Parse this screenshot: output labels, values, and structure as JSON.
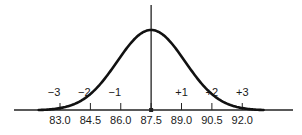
{
  "chart_data": {
    "type": "line",
    "title": "",
    "subtitle": "",
    "xlabel": "",
    "ylabel": "",
    "mean": 87.5,
    "std_dev": 1.5,
    "xlim": [
      79.7,
      93.5
    ],
    "ylim": [
      0,
      1
    ],
    "grid": false,
    "legend": "none",
    "x_ticks": [
      {
        "value": 83.0,
        "label": "83.0"
      },
      {
        "value": 84.5,
        "label": "84.5"
      },
      {
        "value": 86.0,
        "label": "86.0"
      },
      {
        "value": 87.5,
        "label": "87.5"
      },
      {
        "value": 89.0,
        "label": "89.0"
      },
      {
        "value": 90.5,
        "label": "90.5"
      },
      {
        "value": 92.0,
        "label": "92.0"
      }
    ],
    "sigma_labels": [
      {
        "value": 83.0,
        "label": "−3"
      },
      {
        "value": 84.5,
        "label": "−2"
      },
      {
        "value": 86.0,
        "label": "−1"
      },
      {
        "value": 89.0,
        "label": "+1"
      },
      {
        "value": 90.5,
        "label": "+2"
      },
      {
        "value": 92.0,
        "label": "+3"
      }
    ],
    "curve_range_sigma": [
      -3.7,
      3.7
    ],
    "center_line_value": 87.5,
    "colors": {
      "curve": "#111111",
      "axis": "#222222",
      "text": "#1a1a1a"
    }
  }
}
